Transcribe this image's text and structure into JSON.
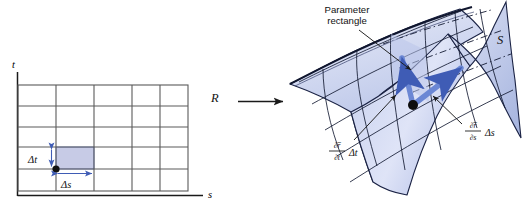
{
  "figure": {
    "type": "math-diagram",
    "background_color": "#ffffff",
    "ink_color": "#1a1a1a",
    "shade_fill": "#c7cbe6",
    "shade_stroke": "#4a63b8",
    "arrow_blue": "#6b87d4",
    "arrow_blue_dark": "#4f6bbf"
  },
  "left_panel": {
    "name": "parameter-domain",
    "region_label": "R",
    "axis": {
      "horizontal_label": "s",
      "vertical_label": "t"
    },
    "grid": {
      "columns": 5,
      "rows": 5
    },
    "shaded_cell": {
      "column_index": 2,
      "row_index": 4,
      "fill": "#c7cbe6"
    },
    "dimension_labels": {
      "delta_t": "Δt",
      "delta_s": "Δs"
    },
    "corner_point_label": ""
  },
  "map_arrow": {
    "name": "mapping-arrow",
    "label": ""
  },
  "right_panel": {
    "name": "surface-image",
    "surface_label": "S",
    "callouts": [
      {
        "name": "parameter-rectangle-callout",
        "line1": "Parameter",
        "line2": "rectangle"
      }
    ],
    "vector_labels": [
      {
        "name": "partial-r-partial-t-label",
        "numerator": "∂r̅",
        "denominator": "∂t",
        "delta": "Δt"
      },
      {
        "name": "partial-r-partial-s-label",
        "numerator": "∂r̅",
        "denominator": "∂s",
        "delta": "Δs"
      }
    ]
  }
}
